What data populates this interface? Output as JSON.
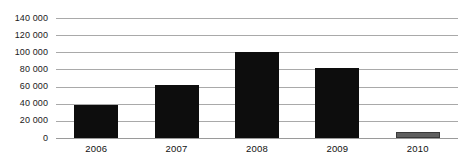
{
  "chart_data": {
    "type": "bar",
    "title": "",
    "subtitle": "",
    "xlabel": "",
    "ylabel": "",
    "categories": [
      "2006",
      "2007",
      "2008",
      "2009",
      "2010"
    ],
    "values": [
      38000,
      62000,
      100000,
      82000,
      7000
    ],
    "series": [
      {
        "name": "",
        "values": [
          38000,
          62000,
          100000,
          82000,
          7000
        ]
      }
    ],
    "ylim": [
      0,
      140000
    ],
    "ytick_values": [
      0,
      20000,
      40000,
      60000,
      80000,
      100000,
      120000,
      140000
    ],
    "ytick_labels": [
      "0",
      "20 000",
      "40 000",
      "60 000",
      "80 000",
      "100 000",
      "120 000",
      "140 000"
    ],
    "grid": {
      "horizontal": true,
      "vertical": false,
      "color": "#a9a9a9"
    },
    "legend": {
      "visible": false,
      "position": "none",
      "entries": []
    },
    "bar_colors": [
      "#0d0d0d",
      "#0d0d0d",
      "#0d0d0d",
      "#0d0d0d",
      "#5f5f5f"
    ],
    "bar_border_colors": [
      "none",
      "none",
      "none",
      "none",
      "#3a3a3a"
    ],
    "annotations": [],
    "data_labels_visible": false,
    "background_color": "#ffffff",
    "axis_label_color": "#1a1a1a"
  }
}
